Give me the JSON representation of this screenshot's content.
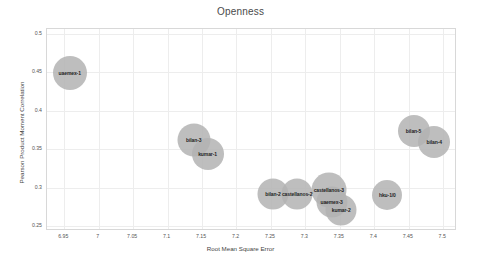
{
  "chart_data": {
    "type": "scatter",
    "title": "Openness",
    "xlabel": "Root Mean Square Error",
    "ylabel": "Pearson Product Moment Correlation",
    "xlim": [
      6.925,
      7.52
    ],
    "ylim": [
      0.244,
      0.506
    ],
    "grid": true,
    "legend": null,
    "xticks": [
      "6.95",
      "7",
      "7.05",
      "7.1",
      "7.15",
      "7.2",
      "7.25",
      "7.3",
      "7.35",
      "7.4",
      "7.45",
      "7.5"
    ],
    "xtick_values": [
      6.95,
      7.0,
      7.05,
      7.1,
      7.15,
      7.2,
      7.25,
      7.3,
      7.35,
      7.4,
      7.45,
      7.5
    ],
    "yticks": [
      "0.5",
      "0.45",
      "0.4",
      "0.35",
      "0.3",
      "0.25"
    ],
    "ytick_values": [
      0.5,
      0.45,
      0.4,
      0.35,
      0.3,
      0.25
    ],
    "bubble_color": "#b3b3b3",
    "points": [
      {
        "label": "uaemex-1",
        "x": 6.958,
        "y": 0.4495,
        "size": 34
      },
      {
        "label": "bilan-3",
        "x": 7.138,
        "y": 0.362,
        "size": 33
      },
      {
        "label": "kumar-1",
        "x": 7.158,
        "y": 0.3445,
        "size": 32
      },
      {
        "label": "bilan-2",
        "x": 7.253,
        "y": 0.292,
        "size": 31
      },
      {
        "label": "castellanos-2",
        "x": 7.288,
        "y": 0.292,
        "size": 31
      },
      {
        "label": "castellanos-3",
        "x": 7.334,
        "y": 0.2975,
        "size": 35
      },
      {
        "label": "uaemex-3",
        "x": 7.338,
        "y": 0.282,
        "size": 31
      },
      {
        "label": "kumar-2",
        "x": 7.352,
        "y": 0.2715,
        "size": 31
      },
      {
        "label": "hku-1/0",
        "x": 7.419,
        "y": 0.2905,
        "size": 30
      },
      {
        "label": "bilan-5",
        "x": 7.457,
        "y": 0.374,
        "size": 32
      },
      {
        "label": "bilan-4",
        "x": 7.487,
        "y": 0.3595,
        "size": 32
      }
    ]
  }
}
